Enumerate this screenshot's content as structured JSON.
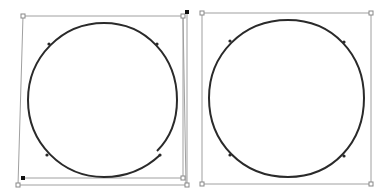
{
  "canvas": {
    "width": 389,
    "height": 194,
    "background": "#ffffff"
  },
  "colors": {
    "frame": "#a0a0a0",
    "curve": "#2a2a2a",
    "handle_fill": "#ffffff",
    "handle_stroke": "#888888",
    "selected_handle": "#111111"
  },
  "figures": [
    {
      "name": "distorted-circle-with-transform-box",
      "state": "open path, skewed bounding box"
    },
    {
      "name": "circle-in-square-bounding-box",
      "state": "closed path, square bounding box"
    }
  ]
}
